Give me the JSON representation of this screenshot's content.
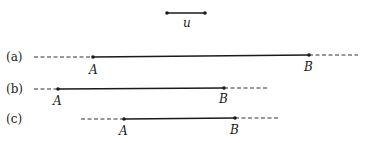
{
  "unit": {
    "label": "u"
  },
  "rows": [
    {
      "label": "(a)",
      "point_a": "A",
      "point_b": "B"
    },
    {
      "label": "(b)",
      "point_a": "A",
      "point_b": "B"
    },
    {
      "label": "(c)",
      "point_a": "A",
      "point_b": "B"
    }
  ],
  "colors": {
    "ink": "#1a1a1a",
    "background": "#ffffff"
  }
}
